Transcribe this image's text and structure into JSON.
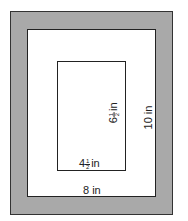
{
  "diagram": {
    "type": "framed picture with mat",
    "outer_frame": {
      "fill": "#a9a9a9",
      "border": "#333333"
    },
    "mat": {
      "fill": "#ffffff",
      "width_label": "8 in",
      "height_label": "10 in"
    },
    "picture": {
      "fill": "#ffffff",
      "width_whole": "4",
      "width_num": "1",
      "width_den": "2",
      "width_unit": "in",
      "height_whole": "6",
      "height_num": "1",
      "height_den": "2",
      "height_unit": "in"
    }
  }
}
